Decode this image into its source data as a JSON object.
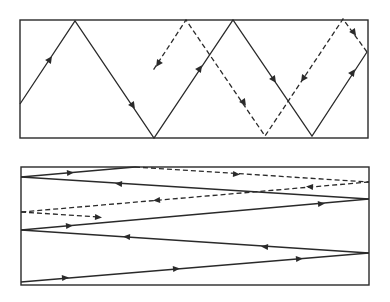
{
  "diagram": {
    "type": "wave-reflection-paths",
    "panels": [
      {
        "name": "top-panel",
        "box": [
          20,
          20,
          348,
          118
        ],
        "solid_path": [
          [
            20,
            104
          ],
          [
            75,
            21
          ],
          [
            154,
            138
          ],
          [
            233,
            20
          ],
          [
            312,
            136
          ],
          [
            367,
            52
          ]
        ],
        "solid_arrows": [
          [
            48,
            62,
            1
          ],
          [
            116,
            82,
            1
          ],
          [
            194,
            76,
            1
          ],
          [
            272,
            80,
            1
          ],
          [
            353,
            73,
            1
          ]
        ],
        "dashed_path": [
          [
            367,
            52
          ],
          [
            343,
            19
          ],
          [
            265,
            136
          ],
          [
            186,
            20
          ],
          [
            152,
            72
          ]
        ],
        "dashed_arrows": [
          [
            355,
            34,
            1
          ],
          [
            306,
            75,
            1
          ],
          [
            242,
            103,
            1
          ],
          [
            161,
            59,
            1
          ]
        ]
      },
      {
        "name": "bottom-panel",
        "box": [
          21,
          167,
          348,
          118
        ],
        "solid_segments": [
          [
            [
              21,
              177
            ],
            [
              130,
              167
            ]
          ],
          [
            [
              21,
              177
            ],
            [
              369,
              199
            ]
          ],
          [
            [
              369,
              199
            ],
            [
              21,
              230
            ]
          ],
          [
            [
              21,
              230
            ],
            [
              369,
              253
            ]
          ],
          [
            [
              369,
              253
            ],
            [
              21,
              282
            ]
          ]
        ],
        "dashed_segments": [
          [
            [
              130,
              167
            ],
            [
              369,
              182
            ]
          ],
          [
            [
              369,
              182
            ],
            [
              21,
              212
            ]
          ],
          [
            [
              21,
              212
            ],
            [
              103,
              217
            ]
          ]
        ]
      }
    ],
    "colors": {
      "line": "#2a2a2a",
      "background": "#ffffff"
    }
  }
}
